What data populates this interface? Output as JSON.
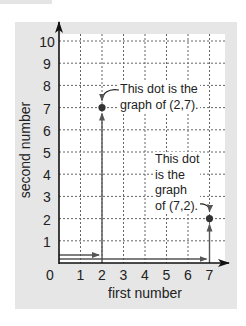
{
  "chart_data": {
    "type": "scatter",
    "title": "",
    "xlabel": "first number",
    "ylabel": "second number",
    "xlim": [
      0,
      7
    ],
    "ylim": [
      0,
      10
    ],
    "x_ticks": [
      "0",
      "1",
      "2",
      "3",
      "4",
      "5",
      "6",
      "7"
    ],
    "y_ticks": [
      "1",
      "2",
      "3",
      "4",
      "5",
      "6",
      "7",
      "8",
      "9",
      "10"
    ],
    "grid": true,
    "grid_style": "dashed",
    "points": [
      {
        "x": 2,
        "y": 7,
        "label": "(2,7)"
      },
      {
        "x": 7,
        "y": 2,
        "label": "(7,2)"
      }
    ],
    "path_arrows": [
      {
        "from": [
          0,
          0
        ],
        "to": [
          2,
          0
        ],
        "then_to": [
          2,
          7
        ]
      },
      {
        "from": [
          0,
          0
        ],
        "to": [
          7,
          0
        ],
        "then_to": [
          7,
          2
        ]
      }
    ],
    "annotations": [
      {
        "target": "(2,7)",
        "lines": [
          "This dot is the",
          "graph of (2,7)."
        ]
      },
      {
        "target": "(7,2)",
        "lines": [
          "This dot",
          "is the",
          "graph",
          "of (7,2)."
        ]
      }
    ],
    "colors": {
      "panel": "#e6e6e6",
      "plot_bg": "#ffffff",
      "axis": "#222222",
      "grid": "#555555",
      "arrow": "#444444",
      "dot": "#333333"
    }
  },
  "axes": {
    "xlabel": "first number",
    "ylabel": "second number",
    "x_ticks": [
      "0",
      "1",
      "2",
      "3",
      "4",
      "5",
      "6",
      "7"
    ],
    "y_ticks": [
      "1",
      "2",
      "3",
      "4",
      "5",
      "6",
      "7",
      "8",
      "9",
      "10"
    ]
  },
  "annotations": {
    "a1": {
      "line1": "This dot is the",
      "line2": "graph of (2,7)."
    },
    "a2": {
      "line1": "This dot",
      "line2": "is the",
      "line3": "graph",
      "line4": "of (7,2)."
    }
  }
}
